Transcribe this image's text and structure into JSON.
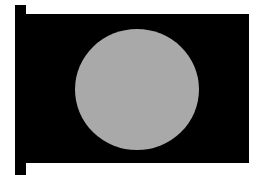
{
  "flag": {
    "description": "Flag with a gray circle on a black field, attached to a pole",
    "colors": {
      "background": "#ffffff",
      "field": "#000000",
      "pole": "#000000",
      "disc": "#a9a9a9"
    }
  }
}
